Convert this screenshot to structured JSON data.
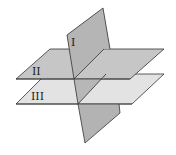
{
  "diagram": {
    "planes": [
      {
        "id": "I",
        "label": "I",
        "orientation": "vertical",
        "fill": "#b3b3b3"
      },
      {
        "id": "II",
        "label": "II",
        "orientation": "horizontal-upper",
        "fill": "#c4c4c4"
      },
      {
        "id": "III",
        "label": "III",
        "orientation": "horizontal-lower",
        "fill": "#e2e2e2"
      }
    ],
    "colors": {
      "stroke": "#333333",
      "plane_I": "#b3b3b3",
      "plane_I_lower": "#b0b0b0",
      "plane_II": "#c4c4c4",
      "plane_III": "#e3e3e3",
      "background": "#ffffff"
    }
  }
}
